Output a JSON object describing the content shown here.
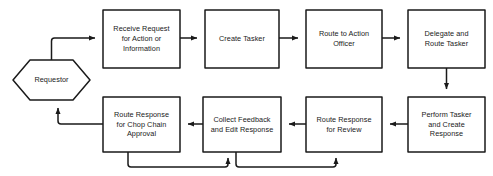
{
  "diagram": {
    "background_color": "#ffffff",
    "stroke_color": "#1a1a1a",
    "text_color": "#1a1a1a",
    "nodes": [
      {
        "id": "requestor",
        "shape": "hexagon",
        "label": "Requestor"
      },
      {
        "id": "receive_request",
        "shape": "rectangle",
        "label": "Receive Request\nfor Action or\nInformation"
      },
      {
        "id": "create_tasker",
        "shape": "rectangle",
        "label": "Create Tasker"
      },
      {
        "id": "route_action",
        "shape": "rectangle",
        "label": "Route to Action\nOfficer"
      },
      {
        "id": "delegate_route",
        "shape": "rectangle",
        "label": "Delegate and\nRoute Tasker"
      },
      {
        "id": "perform_tasker",
        "shape": "rectangle",
        "label": "Perform Tasker\nand Create\nResponse"
      },
      {
        "id": "route_review",
        "shape": "rectangle",
        "label": "Route Response\nfor Review"
      },
      {
        "id": "collect_feedback",
        "shape": "rectangle",
        "label": "Collect Feedback\nand Edit Response"
      },
      {
        "id": "route_chop",
        "shape": "rectangle",
        "label": "Route Response\nfor Chop Chain\nApproval"
      }
    ],
    "edges": [
      {
        "from": "requestor",
        "to": "receive_request"
      },
      {
        "from": "receive_request",
        "to": "create_tasker"
      },
      {
        "from": "create_tasker",
        "to": "route_action"
      },
      {
        "from": "route_action",
        "to": "delegate_route"
      },
      {
        "from": "delegate_route",
        "to": "perform_tasker"
      },
      {
        "from": "perform_tasker",
        "to": "route_review"
      },
      {
        "from": "route_review",
        "to": "collect_feedback"
      },
      {
        "from": "collect_feedback",
        "to": "route_chop"
      },
      {
        "from": "route_chop",
        "to": "requestor"
      },
      {
        "from": "route_chop",
        "to": "collect_feedback"
      },
      {
        "from": "route_review",
        "to": "perform_tasker"
      }
    ]
  }
}
